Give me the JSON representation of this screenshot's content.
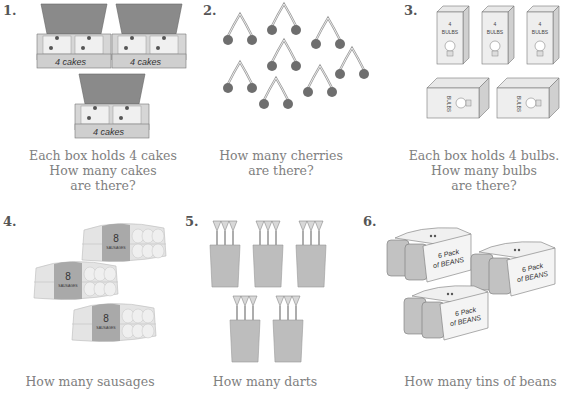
{
  "questions": [
    {
      "number": "1.",
      "item_label": "4 cakes",
      "box_count": 3,
      "lines": [
        "Each box holds 4 cakes",
        "How many cakes",
        "are there?"
      ]
    },
    {
      "number": "2.",
      "pair_count": 9,
      "lines": [
        "How many cherries",
        "are there?"
      ]
    },
    {
      "number": "3.",
      "item_label_top": "4",
      "item_label_bottom": "BULBS",
      "box_count": 5,
      "lines": [
        "Each box holds 4 bulbs.",
        "How many bulbs",
        "are there?"
      ]
    },
    {
      "number": "4.",
      "item_label_top": "8",
      "item_label_bottom": "SAUSAGES",
      "pack_count": 3,
      "lines": [
        "How many sausages"
      ]
    },
    {
      "number": "5.",
      "pot_count": 5,
      "darts_per_pot": 3,
      "lines": [
        "How many darts"
      ]
    },
    {
      "number": "6.",
      "item_label_top": "6 Pack",
      "item_label_bottom": "of BEANS",
      "pack_count": 3,
      "lines": [
        "How many tins of beans"
      ]
    }
  ]
}
